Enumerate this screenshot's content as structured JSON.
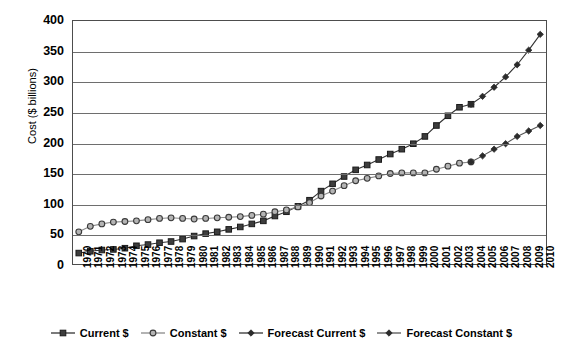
{
  "chart_data": {
    "type": "line",
    "title": "",
    "xlabel": "",
    "ylabel": "Cost ($ billions)",
    "ylim": [
      0,
      400
    ],
    "ytick_step": 50,
    "yticks": [
      0,
      50,
      100,
      150,
      200,
      250,
      300,
      350,
      400
    ],
    "grid": true,
    "legend_position": "bottom",
    "categories": [
      "1970",
      "1971",
      "1972",
      "1973",
      "1974",
      "1975",
      "1976",
      "1977",
      "1978",
      "1979",
      "1980",
      "1981",
      "1982",
      "1983",
      "1984",
      "1985",
      "1986",
      "1987",
      "1988",
      "1989",
      "1990",
      "1991",
      "1992",
      "1993",
      "1994",
      "1995",
      "1996",
      "1997",
      "1998",
      "1999",
      "2000",
      "2001",
      "2002",
      "2003",
      "2004",
      "2005",
      "2006",
      "2007",
      "2008",
      "2009",
      "2010"
    ],
    "series": [
      {
        "name": "Current $",
        "marker": "square-filled",
        "color": "#333333",
        "values": [
          18,
          21,
          23,
          24,
          26,
          30,
          32,
          35,
          37,
          41,
          46,
          50,
          53,
          57,
          61,
          66,
          71,
          79,
          86,
          95,
          105,
          120,
          132,
          144,
          155,
          163,
          172,
          181,
          189,
          198,
          210,
          228,
          244,
          258,
          263,
          null,
          null,
          null,
          null,
          null,
          null
        ]
      },
      {
        "name": "Constant $",
        "marker": "circle-open",
        "color": "#8a8a8a",
        "values": [
          53,
          62,
          66,
          69,
          70,
          71,
          73,
          75,
          76,
          75,
          74,
          75,
          76,
          77,
          78,
          80,
          82,
          86,
          89,
          94,
          101,
          112,
          120,
          129,
          137,
          141,
          145,
          149,
          150,
          150,
          150,
          156,
          161,
          166,
          168,
          null,
          null,
          null,
          null,
          null,
          null
        ]
      },
      {
        "name": "Forecast Current $",
        "marker": "diamond-filled",
        "color": "#333333",
        "values": [
          null,
          null,
          null,
          null,
          null,
          null,
          null,
          null,
          null,
          null,
          null,
          null,
          null,
          null,
          null,
          null,
          null,
          null,
          null,
          null,
          null,
          null,
          null,
          null,
          null,
          null,
          null,
          null,
          null,
          null,
          null,
          null,
          null,
          null,
          263,
          276,
          291,
          308,
          328,
          352,
          378
        ]
      },
      {
        "name": "Forecast Constant $",
        "marker": "diamond-filled",
        "color": "#555555",
        "values": [
          null,
          null,
          null,
          null,
          null,
          null,
          null,
          null,
          null,
          null,
          null,
          null,
          null,
          null,
          null,
          null,
          null,
          null,
          null,
          null,
          null,
          null,
          null,
          null,
          null,
          null,
          null,
          null,
          null,
          null,
          null,
          null,
          null,
          null,
          168,
          178,
          189,
          198,
          210,
          219,
          228
        ]
      }
    ]
  },
  "legend": {
    "items": [
      {
        "label": "Current $"
      },
      {
        "label": "Constant $"
      },
      {
        "label": "Forecast Current $"
      },
      {
        "label": "Forecast Constant $"
      }
    ]
  }
}
